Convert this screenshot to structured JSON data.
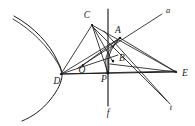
{
  "figure": {
    "kind": "geometry-diagram",
    "background_color": "#ffffff",
    "ink_color": "#1e1e1e",
    "width": 195,
    "height": 126
  },
  "labels": {
    "A": "A",
    "B": "B",
    "C": "C",
    "D": "D",
    "E": "E",
    "O": "O",
    "P": "P",
    "Q": "Q",
    "a": "a",
    "f": "f",
    "t": "t"
  },
  "points": [
    {
      "name": "A",
      "label": "A",
      "x": 120,
      "y": 38,
      "label_x": 118,
      "label_y": 31
    },
    {
      "name": "B",
      "label": "B",
      "x": 113,
      "y": 62,
      "label_x": 121,
      "label_y": 59
    },
    {
      "name": "C",
      "label": "C",
      "x": 92,
      "y": 25,
      "label_x": 87,
      "label_y": 16
    },
    {
      "name": "D",
      "label": "D",
      "x": 61,
      "y": 74,
      "label_x": 57,
      "label_y": 81
    },
    {
      "name": "E",
      "label": "E",
      "x": 176,
      "y": 72,
      "label_x": 185,
      "label_y": 74
    },
    {
      "name": "O",
      "label": "O",
      "x": 83,
      "y": 65,
      "label_x": 82,
      "label_y": 71
    },
    {
      "name": "P",
      "label": "P",
      "x": 108,
      "y": 73,
      "label_x": 104,
      "label_y": 79
    },
    {
      "name": "Q",
      "label": "Q",
      "x": 83,
      "y": 65,
      "label_x": 82,
      "label_y": 71
    }
  ],
  "line_labels": [
    {
      "name": "a",
      "label": "a",
      "label_x": 168,
      "label_y": 11
    },
    {
      "name": "f",
      "label": "f",
      "label_x": 108,
      "label_y": 114
    },
    {
      "name": "t",
      "label": "t",
      "label_x": 171,
      "label_y": 107
    }
  ],
  "segments": [
    {
      "name": "segment-D-C",
      "from": "D",
      "to": "C"
    },
    {
      "name": "segment-C-B",
      "from": "C",
      "to": "B"
    },
    {
      "name": "segment-C-E",
      "from": "C",
      "to": "E"
    },
    {
      "name": "segment-D-E",
      "from": "D",
      "to": "E"
    },
    {
      "name": "segment-D-A",
      "from": "D",
      "to": "A"
    },
    {
      "name": "segment-D-B",
      "from": "D",
      "to": "B"
    },
    {
      "name": "segment-A-E",
      "from": "A",
      "to": "E"
    },
    {
      "name": "segment-B-E",
      "from": "B",
      "to": "E"
    },
    {
      "name": "segment-O-A",
      "from": "O",
      "to": "A"
    },
    {
      "name": "segment-line-a",
      "from": "D",
      "to": "a-end"
    },
    {
      "name": "segment-line-t",
      "from": "C",
      "to": "t-end"
    },
    {
      "name": "segment-line-f",
      "from": "f-top",
      "to": "f-bottom"
    }
  ],
  "curves": [
    {
      "name": "hyperbola-branch",
      "description": "left-opening branch with vertex near D"
    },
    {
      "name": "asymptote",
      "description": "straight asymptote to upper left"
    },
    {
      "name": "conic-arc-AB",
      "description": "small arc joining A down to B and P"
    }
  ]
}
